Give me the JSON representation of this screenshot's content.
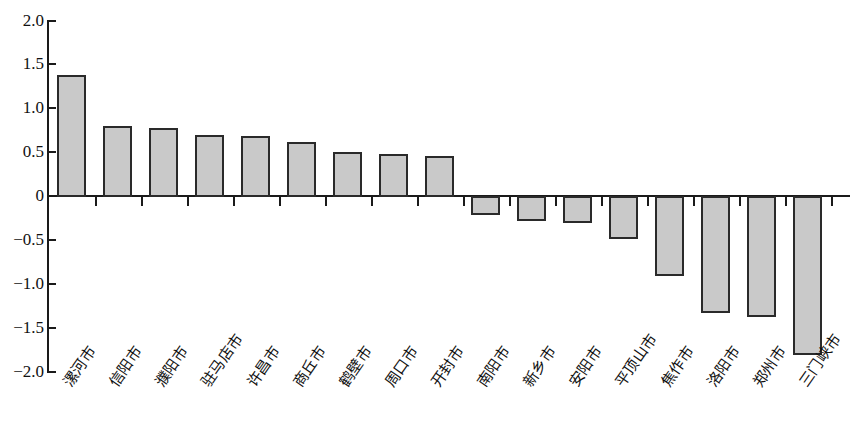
{
  "chart_data": {
    "type": "bar",
    "title": "",
    "subtitle": "",
    "xlabel": "",
    "ylabel": "",
    "ylim": [
      -2.0,
      2.0
    ],
    "grid": false,
    "legend": null,
    "y_ticks": [
      "2.0",
      "1.5",
      "1.0",
      "0.5",
      "0",
      "−0.5",
      "−1.0",
      "−1.5",
      "−2.0"
    ],
    "y_tick_values": [
      2.0,
      1.5,
      1.0,
      0.5,
      0,
      -0.5,
      -1.0,
      -1.5,
      -2.0
    ],
    "categories": [
      "漯河市",
      "信阳市",
      "濮阳市",
      "驻马店市",
      "许昌市",
      "商丘市",
      "鹤壁市",
      "周口市",
      "开封市",
      "南阳市",
      "新乡市",
      "安阳市",
      "平顶山市",
      "焦作市",
      "洛阳市",
      "郑州市",
      "三门峡市"
    ],
    "values": [
      1.38,
      0.8,
      0.78,
      0.69,
      0.68,
      0.61,
      0.5,
      0.48,
      0.46,
      -0.2,
      -0.27,
      -0.3,
      -0.48,
      -0.9,
      -1.32,
      -1.37,
      -1.8
    ],
    "bar_fill_color": "#c9c9c9",
    "bar_edge_color": "#2a2a2a",
    "axis_color": "#1a1a1a"
  }
}
